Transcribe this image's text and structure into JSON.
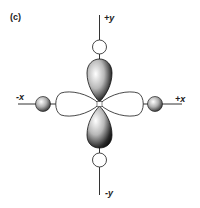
{
  "panel_label": "(c)",
  "axes": {
    "plus_y": "+y",
    "minus_y": "-y",
    "plus_x": "+x",
    "minus_x": "-x"
  },
  "colors": {
    "line": "#333333",
    "lobe_dark": "#1a1a1a",
    "lobe_light": "#f2f2f2",
    "background": "#ffffff"
  },
  "elements": {
    "vertical_lobes": "shaded (filled) lobes along y-axis",
    "horizontal_lobes": "unshaded (outline) lobes along x-axis",
    "y_axis_ligands": "open circles",
    "x_axis_ligands": "shaded spheres"
  }
}
